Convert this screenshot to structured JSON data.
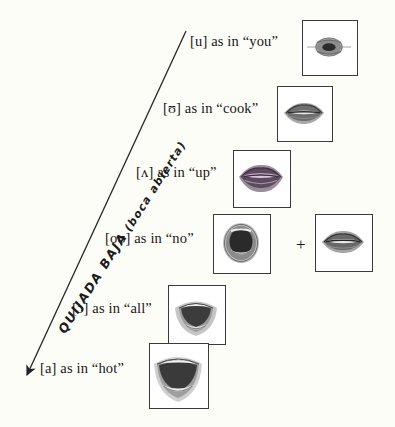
{
  "diagram": {
    "type": "vowel-jaw-position-chart",
    "background_color": "#fdfdf8",
    "axis": {
      "label_main": "QUIJADA BAJA",
      "label_paren": "(boca abierta)",
      "label_full": "QUIJADA BAJA (boca abierta)",
      "direction": "down-left arrow",
      "arrow_head": "solid-triangle",
      "line_color": "#2a2a2a",
      "start": {
        "x": 186,
        "y": 31
      },
      "end": {
        "x": 22,
        "y": 382
      }
    },
    "rows": [
      {
        "id": "u-you",
        "ipa": "[u]",
        "connector": "as in",
        "example": "“you”",
        "label": "[u] as in “you”",
        "images": [
          {
            "name": "mouth-photo-u-you",
            "shape": "rounded-pursed-lips",
            "tint": "#5a5a5a"
          }
        ],
        "has_plus": false
      },
      {
        "id": "upsilon-cook",
        "ipa": "[ʊ]",
        "connector": "as in",
        "example": "“cook”",
        "label": "[ʊ] as in “cook”",
        "images": [
          {
            "name": "mouth-photo-upsilon-cook",
            "shape": "narrow-open-lips",
            "tint": "#4e4e4e"
          }
        ],
        "has_plus": false
      },
      {
        "id": "caret-up",
        "ipa": "[ʌ]",
        "connector": "as in",
        "example": "“up”",
        "label": "[ʌ] as in “up”",
        "images": [
          {
            "name": "mouth-photo-caret-up",
            "shape": "relaxed-open-lips",
            "tint": "#8f6f90"
          }
        ],
        "has_plus": false
      },
      {
        "id": "ou-no",
        "ipa": "[oʊ]",
        "connector": "as in",
        "example": "“no”",
        "label": "[oʊ] as in “no”",
        "plus_symbol": "+",
        "images": [
          {
            "name": "mouth-photo-ou-no-open",
            "shape": "round-open-mouth",
            "tint": "#3d3d3d"
          },
          {
            "name": "mouth-photo-ou-no-close",
            "shape": "narrow-open-lips",
            "tint": "#4e4e4e"
          }
        ],
        "has_plus": true
      },
      {
        "id": "openo-all",
        "ipa": "[ɔ]",
        "connector": "as in",
        "example": "“all”",
        "label": "[ɔ] as in “all”",
        "images": [
          {
            "name": "mouth-photo-openo-all",
            "shape": "wide-oval-open-mouth",
            "tint": "#4a4a4a"
          }
        ],
        "has_plus": false
      },
      {
        "id": "a-hot",
        "ipa": "[a]",
        "connector": "as in",
        "example": "“hot”",
        "label": "[a] as in “hot”",
        "images": [
          {
            "name": "mouth-photo-a-hot",
            "shape": "widest-open-mouth",
            "tint": "#555555"
          }
        ],
        "has_plus": false
      }
    ]
  }
}
